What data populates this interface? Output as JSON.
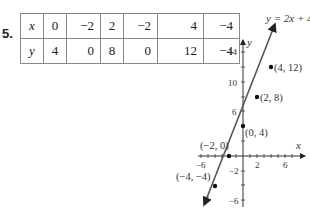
{
  "problem_number": "5.",
  "table": {
    "row_x": {
      "label": "x",
      "values": [
        "0",
        "−2",
        "2",
        "−2",
        "4",
        "−4"
      ]
    },
    "row_y": {
      "label": "y",
      "values": [
        "4",
        "0",
        "8",
        "0",
        "12",
        "−4"
      ]
    }
  },
  "graph": {
    "equation_label": "y = 2x + 4",
    "x_axis_label": "x",
    "y_axis_label": "y",
    "x_ticks": [
      "−6",
      "2",
      "6"
    ],
    "y_ticks": [
      "14",
      "10",
      "6",
      "−2",
      "−6"
    ],
    "points": [
      {
        "label": "(4, 12)",
        "x": 4,
        "y": 12
      },
      {
        "label": "(2, 8)",
        "x": 2,
        "y": 8
      },
      {
        "label": "(0, 4)",
        "x": 0,
        "y": 4
      },
      {
        "label": "(−2, 0)",
        "x": -2,
        "y": 0
      },
      {
        "label": "(−4, −4)",
        "x": -4,
        "y": -4
      }
    ]
  }
}
